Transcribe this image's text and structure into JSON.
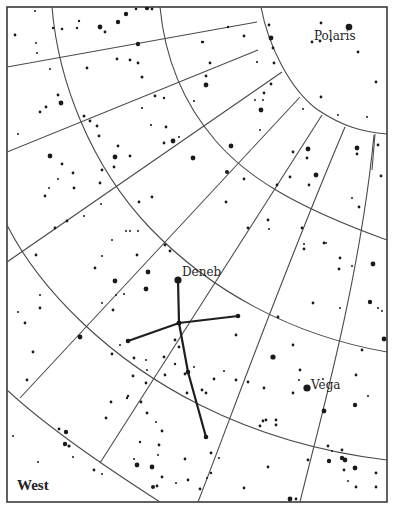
{
  "map": {
    "title": "Star chart",
    "direction_label": "West",
    "frame": {
      "x": 7,
      "y": 7,
      "w": 380,
      "h": 495
    },
    "colors": {
      "ink": "#1a1a1a",
      "grid": "#4a4a4a",
      "paper": "#ffffff"
    },
    "labels": [
      {
        "name": "Polaris",
        "x": 314,
        "y": 40
      },
      {
        "name": "Deneb",
        "x": 182,
        "y": 276
      },
      {
        "name": "Vega",
        "x": 311,
        "y": 389
      }
    ],
    "named_stars": [
      {
        "name": "Polaris",
        "x": 349,
        "y": 27,
        "r": 3.3
      },
      {
        "name": "Deneb",
        "x": 178,
        "y": 280,
        "r": 3.6
      },
      {
        "name": "Vega",
        "x": 307,
        "y": 388,
        "r": 3.6
      }
    ],
    "constellation": {
      "name": "Cygnus",
      "lines": [
        [
          [
            178,
            280
          ],
          [
            179,
            323
          ]
        ],
        [
          [
            128,
            341
          ],
          [
            179,
            323
          ],
          [
            238,
            316
          ]
        ],
        [
          [
            179,
            323
          ],
          [
            188,
            372
          ],
          [
            206,
            437
          ]
        ]
      ]
    },
    "declination_arcs": [
      "M261,7 C268,45 290,90 318,110 C342,126 362,132 387,134",
      "M160,7 C165,60 185,105 215,140 C245,175 290,205 387,240",
      "M52,7 C58,80 90,165 150,228 C210,290 290,335 387,352",
      "M7,225 C40,290 110,360 200,405 C260,435 320,452 387,460",
      "M7,390 C50,430 110,470 160,502"
    ],
    "hour_lines": [
      "M7,67 L257,22",
      "M7,152 L258,50",
      "M7,262 L282,72",
      "M20,398 L300,97",
      "M100,463 L322,115",
      "M198,502 C230,420 280,280 345,127",
      "M300,502 C320,420 360,280 374,135",
      "M375,134 L372,170"
    ],
    "stars": [
      [
        35,
        11,
        1
      ],
      [
        15,
        35,
        1.4
      ],
      [
        36,
        43,
        1
      ],
      [
        37,
        53,
        1
      ],
      [
        53,
        28,
        1.2
      ],
      [
        62,
        29,
        1.3
      ],
      [
        77,
        28,
        1.2
      ],
      [
        79,
        21,
        1.2
      ],
      [
        100,
        27,
        2.4
      ],
      [
        105,
        32,
        1.4
      ],
      [
        118,
        22,
        2.2
      ],
      [
        126,
        14,
        2.2
      ],
      [
        136,
        9,
        1.3
      ],
      [
        147,
        8,
        2.2
      ],
      [
        152,
        9,
        1.4
      ],
      [
        138,
        44,
        2.2
      ],
      [
        117,
        59,
        1.4
      ],
      [
        130,
        60,
        1.4
      ],
      [
        138,
        63,
        1.4
      ],
      [
        142,
        77,
        1.5
      ],
      [
        87,
        68,
        1.4
      ],
      [
        50,
        69,
        1
      ],
      [
        58,
        95,
        1.4
      ],
      [
        61,
        103,
        2.4
      ],
      [
        46,
        107,
        1.4
      ],
      [
        40,
        112,
        1.4
      ],
      [
        18,
        134,
        1
      ],
      [
        84,
        116,
        1.5
      ],
      [
        90,
        121,
        1.4
      ],
      [
        97,
        126,
        1.4
      ],
      [
        99,
        136,
        1.4
      ],
      [
        142,
        108,
        1.1
      ],
      [
        155,
        96,
        1.4
      ],
      [
        164,
        98,
        1.2
      ],
      [
        151,
        125,
        1.1
      ],
      [
        166,
        127,
        1.4
      ],
      [
        164,
        143,
        1.4
      ],
      [
        173,
        141,
        2.4
      ],
      [
        179,
        137,
        1
      ],
      [
        193,
        158,
        2.4
      ],
      [
        203,
        42,
        1.2
      ],
      [
        210,
        63,
        1.4
      ],
      [
        206,
        76,
        1.4
      ],
      [
        206,
        85,
        2.4
      ],
      [
        194,
        101,
        1.1
      ],
      [
        228,
        27,
        1.2
      ],
      [
        50,
        156,
        2.4
      ],
      [
        62,
        164,
        1.4
      ],
      [
        73,
        173,
        1.4
      ],
      [
        58,
        179,
        1
      ],
      [
        49,
        188,
        1
      ],
      [
        45,
        196,
        1.4
      ],
      [
        74,
        188,
        1.4
      ],
      [
        118,
        146,
        1.4
      ],
      [
        115,
        157,
        2.4
      ],
      [
        114,
        167,
        1.4
      ],
      [
        130,
        156,
        1.4
      ],
      [
        102,
        170,
        1.4
      ],
      [
        100,
        183,
        1.4
      ],
      [
        101,
        204,
        1
      ],
      [
        139,
        202,
        1.4
      ],
      [
        152,
        197,
        1.4
      ],
      [
        55,
        228,
        1.4
      ],
      [
        67,
        221,
        1.4
      ],
      [
        84,
        216,
        1
      ],
      [
        36,
        255,
        1.4
      ],
      [
        126,
        231,
        1
      ],
      [
        130,
        231,
        1
      ],
      [
        138,
        231,
        1
      ],
      [
        112,
        240,
        1
      ],
      [
        165,
        245,
        1.4
      ],
      [
        170,
        251,
        1.4
      ],
      [
        137,
        255,
        1.4
      ],
      [
        102,
        256,
        1
      ],
      [
        95,
        268,
        1.4
      ],
      [
        148,
        272,
        2.4
      ],
      [
        146,
        289,
        2.4
      ],
      [
        115,
        281,
        2.4
      ],
      [
        124,
        294,
        1
      ],
      [
        113,
        310,
        1.4
      ],
      [
        116,
        295,
        1
      ],
      [
        102,
        303,
        1
      ],
      [
        40,
        295,
        1
      ],
      [
        40,
        308,
        1.4
      ],
      [
        18,
        312,
        1
      ],
      [
        25,
        323,
        1.4
      ],
      [
        80,
        337,
        2.4
      ],
      [
        33,
        352,
        1.4
      ],
      [
        27,
        380,
        1.4
      ],
      [
        13,
        436,
        1
      ],
      [
        59,
        429,
        1.4
      ],
      [
        66,
        432,
        2.2
      ],
      [
        65,
        444,
        2.2
      ],
      [
        69,
        446,
        1.6
      ],
      [
        73,
        457,
        1
      ],
      [
        38,
        462,
        1
      ],
      [
        94,
        470,
        1.4
      ],
      [
        102,
        474,
        1
      ],
      [
        202,
        42,
        1.2
      ],
      [
        269,
        25,
        1.4
      ],
      [
        273,
        48,
        1.4
      ],
      [
        271,
        84,
        1.4
      ],
      [
        257,
        62,
        1.1
      ],
      [
        264,
        93,
        1.4
      ],
      [
        263,
        100,
        1
      ],
      [
        261,
        110,
        2.4
      ],
      [
        260,
        130,
        1
      ],
      [
        255,
        100,
        1
      ],
      [
        321,
        23,
        1.4
      ],
      [
        312,
        42,
        1.4
      ],
      [
        320,
        41,
        1.4
      ],
      [
        331,
        41,
        1
      ],
      [
        358,
        52,
        1.4
      ],
      [
        376,
        82,
        1.4
      ],
      [
        367,
        117,
        1
      ],
      [
        321,
        97,
        1.4
      ],
      [
        303,
        109,
        1
      ],
      [
        338,
        115,
        1
      ],
      [
        271,
        38,
        2.4
      ],
      [
        244,
        36,
        1.4
      ],
      [
        274,
        63,
        1.4
      ],
      [
        231,
        146,
        2.4
      ],
      [
        227,
        172,
        2
      ],
      [
        244,
        179,
        1.4
      ],
      [
        277,
        185,
        1.4
      ],
      [
        307,
        158,
        1.4
      ],
      [
        290,
        177,
        1.4
      ],
      [
        308,
        149,
        2.4
      ],
      [
        316,
        175,
        2.4
      ],
      [
        309,
        185,
        1.4
      ],
      [
        357,
        148,
        2.4
      ],
      [
        357,
        154,
        1.4
      ],
      [
        378,
        145,
        1.4
      ],
      [
        381,
        176,
        1.4
      ],
      [
        352,
        198,
        1
      ],
      [
        359,
        207,
        1.4
      ],
      [
        324,
        243,
        1.4
      ],
      [
        302,
        228,
        1.4
      ],
      [
        293,
        152,
        1.4
      ],
      [
        226,
        202,
        1.4
      ],
      [
        248,
        228,
        1.4
      ],
      [
        268,
        220,
        1.4
      ],
      [
        269,
        229,
        1
      ],
      [
        304,
        249,
        1.4
      ],
      [
        304,
        244,
        1
      ],
      [
        326,
        243,
        1
      ],
      [
        340,
        258,
        1.4
      ],
      [
        339,
        269,
        1.4
      ],
      [
        373,
        264,
        2.4
      ],
      [
        370,
        302,
        2.2
      ],
      [
        378,
        308,
        1
      ],
      [
        352,
        266,
        1
      ],
      [
        340,
        308,
        1
      ],
      [
        313,
        303,
        1.4
      ],
      [
        293,
        345,
        1.4
      ],
      [
        273,
        357,
        2.6
      ],
      [
        300,
        370,
        1.4
      ],
      [
        323,
        379,
        1
      ],
      [
        356,
        375,
        1.4
      ],
      [
        368,
        396,
        1
      ],
      [
        355,
        405,
        2.2
      ],
      [
        324,
        411,
        2.4
      ],
      [
        293,
        393,
        1.4
      ],
      [
        299,
        380,
        1
      ],
      [
        248,
        382,
        1.4
      ],
      [
        236,
        380,
        1.4
      ],
      [
        224,
        371,
        1
      ],
      [
        214,
        379,
        1.4
      ],
      [
        206,
        393,
        1.4
      ],
      [
        194,
        367,
        1
      ],
      [
        202,
        390,
        1.4
      ],
      [
        187,
        393,
        1.4
      ],
      [
        185,
        374,
        1.4
      ],
      [
        179,
        347,
        1.4
      ],
      [
        175,
        340,
        1.4
      ],
      [
        175,
        364,
        1.2
      ],
      [
        164,
        357,
        1.4
      ],
      [
        165,
        375,
        1.4
      ],
      [
        146,
        360,
        1
      ],
      [
        147,
        370,
        1
      ],
      [
        134,
        358,
        1.4
      ],
      [
        120,
        345,
        1
      ],
      [
        112,
        354,
        1.4
      ],
      [
        133,
        376,
        1.4
      ],
      [
        146,
        383,
        1.4
      ],
      [
        128,
        396,
        1.2
      ],
      [
        111,
        402,
        1.4
      ],
      [
        106,
        418,
        1.4
      ],
      [
        127,
        398,
        1.2
      ],
      [
        141,
        402,
        1.4
      ],
      [
        147,
        413,
        1.4
      ],
      [
        156,
        422,
        1
      ],
      [
        162,
        431,
        1.4
      ],
      [
        159,
        445,
        1.4
      ],
      [
        158,
        455,
        1
      ],
      [
        137,
        465,
        2.4
      ],
      [
        140,
        442,
        1.2
      ],
      [
        134,
        459,
        1
      ],
      [
        152,
        467,
        2.4
      ],
      [
        153,
        487,
        2
      ],
      [
        157,
        486,
        1.4
      ],
      [
        162,
        477,
        1.4
      ],
      [
        176,
        483,
        1
      ],
      [
        185,
        459,
        1.4
      ],
      [
        188,
        480,
        1.4
      ],
      [
        200,
        489,
        1.4
      ],
      [
        207,
        478,
        1
      ],
      [
        211,
        453,
        1.4
      ],
      [
        219,
        458,
        1
      ],
      [
        211,
        473,
        1.2
      ],
      [
        260,
        426,
        1.4
      ],
      [
        263,
        421,
        1.4
      ],
      [
        266,
        420,
        1.4
      ],
      [
        276,
        420,
        1.4
      ],
      [
        276,
        425,
        1.4
      ],
      [
        264,
        388,
        1.4
      ],
      [
        244,
        488,
        1.4
      ],
      [
        268,
        467,
        1.4
      ],
      [
        290,
        499,
        2.4
      ],
      [
        296,
        499,
        1.4
      ],
      [
        328,
        446,
        1.4
      ],
      [
        332,
        451,
        1
      ],
      [
        342,
        450,
        1.4
      ],
      [
        345,
        460,
        2.4
      ],
      [
        355,
        468,
        2.4
      ],
      [
        344,
        470,
        1.4
      ],
      [
        376,
        487,
        1.4
      ],
      [
        308,
        460,
        1.4
      ],
      [
        329,
        461,
        2.2
      ],
      [
        342,
        458,
        2.2
      ],
      [
        356,
        487,
        1.4
      ],
      [
        348,
        481,
        1
      ],
      [
        376,
        473,
        1.4
      ],
      [
        384,
        339,
        2.4
      ],
      [
        382,
        311,
        1
      ],
      [
        362,
        350,
        1.4
      ],
      [
        278,
        317,
        1.4
      ],
      [
        236,
        335,
        1.4
      ]
    ]
  }
}
